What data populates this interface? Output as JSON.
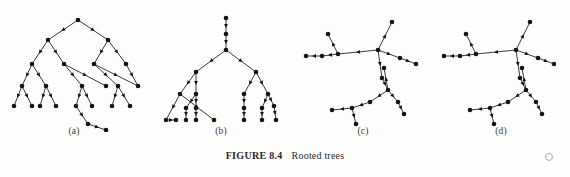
{
  "figure": {
    "caption_number": "FIGURE 8.4",
    "caption_text": "Rooted trees",
    "panel_labels": [
      "(a)",
      "(b)",
      "(c)",
      "(d)"
    ],
    "colors": {
      "background": "#fdfdfc",
      "ink": "#141414",
      "edge": "#1a1a1a",
      "caption": "#2b2b2b",
      "stray_mark": "#b9a9ae"
    },
    "node_radius_px": 2.3,
    "edge_width_px": 0.85
  },
  "chart_data": {
    "type": "diagram",
    "subtitle": "",
    "xlabel": "",
    "ylabel": "",
    "diagram_kind": "rooted-tree-graphs",
    "panel_count": 4,
    "edges_directed": true,
    "arrowheads": "midpoint of each edge, pointing away from the root",
    "panels": [
      {
        "label": "(a)",
        "description": "Balanced binary rooted tree drawn top-down with one deep chain hanging below the right subtree",
        "node_count": 23,
        "edge_count": 22,
        "root": "n0",
        "nodes": [
          {
            "id": "n0",
            "x": 72,
            "y": 14
          },
          {
            "id": "n1",
            "x": 42,
            "y": 34
          },
          {
            "id": "n2",
            "x": 102,
            "y": 34
          },
          {
            "id": "n3",
            "x": 26,
            "y": 58
          },
          {
            "id": "n4",
            "x": 58,
            "y": 58
          },
          {
            "id": "n5",
            "x": 88,
            "y": 58
          },
          {
            "id": "n6",
            "x": 120,
            "y": 58
          },
          {
            "id": "n7",
            "x": 16,
            "y": 80
          },
          {
            "id": "n8",
            "x": 40,
            "y": 80
          },
          {
            "id": "n9",
            "x": 76,
            "y": 80
          },
          {
            "id": "n10",
            "x": 100,
            "y": 80
          },
          {
            "id": "n11",
            "x": 112,
            "y": 80
          },
          {
            "id": "n12",
            "x": 132,
            "y": 80
          },
          {
            "id": "n13",
            "x": 8,
            "y": 100
          },
          {
            "id": "n14",
            "x": 26,
            "y": 100
          },
          {
            "id": "n15",
            "x": 34,
            "y": 100
          },
          {
            "id": "n16",
            "x": 50,
            "y": 100
          },
          {
            "id": "n17",
            "x": 70,
            "y": 100
          },
          {
            "id": "n18",
            "x": 86,
            "y": 100
          },
          {
            "id": "n19",
            "x": 106,
            "y": 100
          },
          {
            "id": "n20",
            "x": 124,
            "y": 100
          },
          {
            "id": "n21",
            "x": 82,
            "y": 118
          },
          {
            "id": "n22",
            "x": 100,
            "y": 124
          }
        ],
        "edges": [
          [
            "n0",
            "n1"
          ],
          [
            "n0",
            "n2"
          ],
          [
            "n1",
            "n3"
          ],
          [
            "n1",
            "n4"
          ],
          [
            "n2",
            "n5"
          ],
          [
            "n2",
            "n6"
          ],
          [
            "n3",
            "n7"
          ],
          [
            "n3",
            "n8"
          ],
          [
            "n4",
            "n9"
          ],
          [
            "n4",
            "n10"
          ],
          [
            "n5",
            "n11"
          ],
          [
            "n5",
            "n12"
          ],
          [
            "n7",
            "n13"
          ],
          [
            "n7",
            "n14"
          ],
          [
            "n8",
            "n15"
          ],
          [
            "n8",
            "n16"
          ],
          [
            "n9",
            "n17"
          ],
          [
            "n9",
            "n18"
          ],
          [
            "n11",
            "n19"
          ],
          [
            "n11",
            "n20"
          ],
          [
            "n17",
            "n21"
          ],
          [
            "n21",
            "n22"
          ],
          [
            "n6",
            "n12"
          ]
        ]
      },
      {
        "label": "(b)",
        "description": "Rooted tree with a vertical stem from the root and two large fan-shaped subtrees; many edges drawn vertically",
        "node_count": 22,
        "edge_count": 21,
        "root": "m0",
        "nodes": [
          {
            "id": "m0",
            "x": 70,
            "y": 12
          },
          {
            "id": "m1",
            "x": 70,
            "y": 28
          },
          {
            "id": "m2",
            "x": 70,
            "y": 44
          },
          {
            "id": "m3",
            "x": 40,
            "y": 66
          },
          {
            "id": "m4",
            "x": 100,
            "y": 66
          },
          {
            "id": "m5",
            "x": 24,
            "y": 88
          },
          {
            "id": "m6",
            "x": 40,
            "y": 88
          },
          {
            "id": "m7",
            "x": 88,
            "y": 88
          },
          {
            "id": "m8",
            "x": 112,
            "y": 88
          },
          {
            "id": "m9",
            "x": 10,
            "y": 114
          },
          {
            "id": "m10",
            "x": 30,
            "y": 102
          },
          {
            "id": "m11",
            "x": 40,
            "y": 102
          },
          {
            "id": "m12",
            "x": 30,
            "y": 114
          },
          {
            "id": "m13",
            "x": 40,
            "y": 114
          },
          {
            "id": "m14",
            "x": 88,
            "y": 102
          },
          {
            "id": "m15",
            "x": 88,
            "y": 114
          },
          {
            "id": "m16",
            "x": 106,
            "y": 102
          },
          {
            "id": "m17",
            "x": 106,
            "y": 114
          },
          {
            "id": "m18",
            "x": 120,
            "y": 114
          },
          {
            "id": "m19",
            "x": 118,
            "y": 100
          },
          {
            "id": "m20",
            "x": 58,
            "y": 114
          },
          {
            "id": "m21",
            "x": 20,
            "y": 114
          }
        ],
        "edges": [
          [
            "m0",
            "m1"
          ],
          [
            "m1",
            "m2"
          ],
          [
            "m2",
            "m3"
          ],
          [
            "m2",
            "m4"
          ],
          [
            "m3",
            "m5"
          ],
          [
            "m3",
            "m6"
          ],
          [
            "m4",
            "m7"
          ],
          [
            "m4",
            "m8"
          ],
          [
            "m5",
            "m9"
          ],
          [
            "m6",
            "m10"
          ],
          [
            "m6",
            "m11"
          ],
          [
            "m10",
            "m12"
          ],
          [
            "m11",
            "m13"
          ],
          [
            "m7",
            "m14"
          ],
          [
            "m14",
            "m15"
          ],
          [
            "m8",
            "m16"
          ],
          [
            "m16",
            "m17"
          ],
          [
            "m8",
            "m19"
          ],
          [
            "m19",
            "m18"
          ],
          [
            "m5",
            "m20"
          ],
          [
            "m9",
            "m21"
          ]
        ]
      },
      {
        "label": "(c)",
        "description": "Free-form rooted tree drawn with a central hub, a horizontal branch going left and a long branch descending to a lower cluster",
        "node_count": 17,
        "edge_count": 16,
        "root": "p0",
        "nodes": [
          {
            "id": "p0",
            "x": 74,
            "y": 44
          },
          {
            "id": "p1",
            "x": 88,
            "y": 16
          },
          {
            "id": "p2",
            "x": 34,
            "y": 48
          },
          {
            "id": "p3",
            "x": 18,
            "y": 50
          },
          {
            "id": "p4",
            "x": 2,
            "y": 50
          },
          {
            "id": "p5",
            "x": 24,
            "y": 28
          },
          {
            "id": "p6",
            "x": 96,
            "y": 52
          },
          {
            "id": "p7",
            "x": 112,
            "y": 58
          },
          {
            "id": "p8",
            "x": 80,
            "y": 62
          },
          {
            "id": "p9",
            "x": 84,
            "y": 84
          },
          {
            "id": "p10",
            "x": 66,
            "y": 96
          },
          {
            "id": "p11",
            "x": 48,
            "y": 102
          },
          {
            "id": "p12",
            "x": 28,
            "y": 104
          },
          {
            "id": "p13",
            "x": 52,
            "y": 118
          },
          {
            "id": "p14",
            "x": 94,
            "y": 96
          },
          {
            "id": "p15",
            "x": 100,
            "y": 108
          },
          {
            "id": "p16",
            "x": 78,
            "y": 72
          }
        ],
        "edges": [
          [
            "p0",
            "p1"
          ],
          [
            "p0",
            "p2"
          ],
          [
            "p2",
            "p3"
          ],
          [
            "p3",
            "p4"
          ],
          [
            "p2",
            "p5"
          ],
          [
            "p0",
            "p6"
          ],
          [
            "p6",
            "p7"
          ],
          [
            "p0",
            "p16"
          ],
          [
            "p16",
            "p9"
          ],
          [
            "p9",
            "p10"
          ],
          [
            "p10",
            "p11"
          ],
          [
            "p11",
            "p12"
          ],
          [
            "p11",
            "p13"
          ],
          [
            "p9",
            "p14"
          ],
          [
            "p14",
            "p15"
          ],
          [
            "p9",
            "p8"
          ]
        ]
      },
      {
        "label": "(d)",
        "description": "Tree with the same shape as (c) — a second copy of the free-form rooted tree, identical layout",
        "node_count": 17,
        "edge_count": 16,
        "root": "q0",
        "nodes": [
          {
            "id": "q0",
            "x": 74,
            "y": 44
          },
          {
            "id": "q1",
            "x": 88,
            "y": 16
          },
          {
            "id": "q2",
            "x": 34,
            "y": 48
          },
          {
            "id": "q3",
            "x": 18,
            "y": 50
          },
          {
            "id": "q4",
            "x": 2,
            "y": 50
          },
          {
            "id": "q5",
            "x": 24,
            "y": 28
          },
          {
            "id": "q6",
            "x": 96,
            "y": 52
          },
          {
            "id": "q7",
            "x": 112,
            "y": 58
          },
          {
            "id": "q8",
            "x": 80,
            "y": 62
          },
          {
            "id": "q9",
            "x": 84,
            "y": 84
          },
          {
            "id": "q10",
            "x": 66,
            "y": 96
          },
          {
            "id": "q11",
            "x": 48,
            "y": 102
          },
          {
            "id": "q12",
            "x": 28,
            "y": 104
          },
          {
            "id": "q13",
            "x": 52,
            "y": 118
          },
          {
            "id": "q14",
            "x": 94,
            "y": 96
          },
          {
            "id": "q15",
            "x": 100,
            "y": 108
          },
          {
            "id": "q16",
            "x": 78,
            "y": 72
          }
        ],
        "edges": [
          [
            "q0",
            "q1"
          ],
          [
            "q0",
            "q2"
          ],
          [
            "q2",
            "q3"
          ],
          [
            "q3",
            "q4"
          ],
          [
            "q2",
            "q5"
          ],
          [
            "q0",
            "q6"
          ],
          [
            "q6",
            "q7"
          ],
          [
            "q0",
            "q16"
          ],
          [
            "q16",
            "q9"
          ],
          [
            "q9",
            "q10"
          ],
          [
            "q10",
            "q11"
          ],
          [
            "q11",
            "q12"
          ],
          [
            "q11",
            "q13"
          ],
          [
            "q9",
            "q14"
          ],
          [
            "q14",
            "q15"
          ],
          [
            "q9",
            "q8"
          ]
        ]
      }
    ]
  }
}
